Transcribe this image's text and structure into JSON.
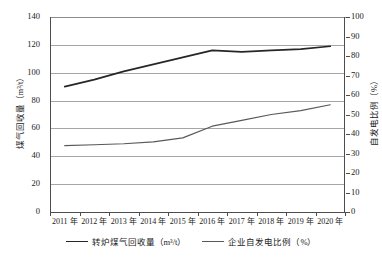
{
  "chart_data": {
    "type": "line",
    "title": "",
    "xlabel": "",
    "categories": [
      "2011 年",
      "2012 年",
      "2013 年",
      "2014 年",
      "2015 年",
      "2016 年",
      "2017 年",
      "2018 年",
      "2019 年",
      "2020 年"
    ],
    "grid": true,
    "legend_position": "bottom",
    "axes": {
      "left": {
        "label": "煤气回收量（m³/t）",
        "ylim": [
          0,
          140
        ],
        "ticks": [
          "0",
          "20",
          "40",
          "60",
          "80",
          "100",
          "120",
          "140"
        ],
        "tick_values": [
          0,
          20,
          40,
          60,
          80,
          100,
          120,
          140
        ]
      },
      "right": {
        "label": "自发电比例（%）",
        "ylim": [
          0,
          100
        ],
        "ticks": [
          "0",
          "10",
          "20",
          "30",
          "40",
          "50",
          "60",
          "70",
          "80",
          "90",
          "100"
        ],
        "tick_values": [
          0,
          10,
          20,
          30,
          40,
          50,
          60,
          70,
          80,
          90,
          100
        ]
      }
    },
    "series": [
      {
        "name": "转炉煤气回收量（m³/t）",
        "axis": "left",
        "unit": "m³/t",
        "color": "#262626",
        "values": [
          90,
          95,
          101,
          106,
          111,
          116,
          115,
          116,
          117,
          119
        ]
      },
      {
        "name": "企业自发电比例（%）",
        "axis": "right",
        "unit": "%",
        "color": "#595959",
        "values": [
          34,
          34.5,
          35,
          36,
          38,
          44,
          47,
          50,
          52,
          55
        ]
      }
    ]
  },
  "legend": {
    "items": [
      {
        "label": "转炉煤气回收量（m³/t）"
      },
      {
        "label": "企业自发电比例（%）"
      }
    ]
  }
}
